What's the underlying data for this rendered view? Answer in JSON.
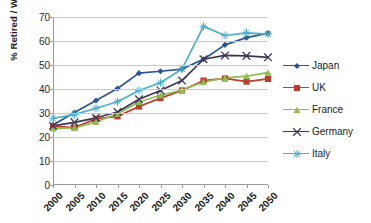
{
  "chart_data": {
    "type": "line",
    "title": "",
    "xlabel": "",
    "ylabel": "% Retired / Workforce",
    "categories": [
      "2000",
      "2005",
      "2010",
      "2015",
      "2020",
      "2025",
      "2030",
      "2035",
      "2040",
      "2045",
      "2050"
    ],
    "x": [
      2000,
      2005,
      2010,
      2015,
      2020,
      2025,
      2030,
      2035,
      2040,
      2045,
      2050
    ],
    "ylim": [
      0,
      70
    ],
    "ytick_values": [
      0,
      10,
      20,
      30,
      40,
      50,
      60,
      70
    ],
    "ytick_labels": [
      "0",
      "10",
      "20",
      "30",
      "40",
      "50",
      "60",
      "70"
    ],
    "grid": true,
    "grid_axis": "y",
    "legend_position": "right",
    "series": [
      {
        "name": "Japan",
        "color": "#2B5597",
        "marker": "diamond",
        "values": [
          25.0,
          30.2,
          35.2,
          40.2,
          46.6,
          47.4,
          48.3,
          52.4,
          58.4,
          61.4,
          63.3
        ]
      },
      {
        "name": "UK",
        "color": "#BE3D2E",
        "marker": "square",
        "values": [
          24.4,
          23.9,
          27.6,
          28.6,
          32.7,
          36.2,
          39.4,
          43.5,
          44.4,
          43.1,
          44.2
        ]
      },
      {
        "name": "France",
        "color": "#8CBF51",
        "marker": "triangle",
        "values": [
          23.6,
          23.8,
          26.3,
          29.7,
          34.6,
          37.4,
          39.6,
          42.9,
          44.6,
          45.4,
          46.8
        ]
      },
      {
        "name": "Germany",
        "color": "#3B3556",
        "marker": "x",
        "values": [
          24.6,
          26.1,
          28.0,
          30.4,
          35.7,
          39.4,
          43.5,
          52.4,
          54.0,
          53.8,
          53.2
        ]
      },
      {
        "name": "Italy",
        "color": "#49AFCD",
        "marker": "asterisk",
        "values": [
          27.8,
          29.3,
          32.0,
          34.7,
          39.4,
          42.6,
          48.3,
          66.1,
          62.3,
          63.4,
          62.9
        ]
      }
    ]
  },
  "axes": {
    "y_title": "% Retired / Workforce"
  }
}
